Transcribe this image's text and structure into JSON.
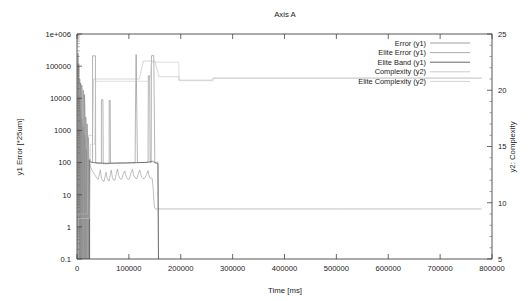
{
  "chart_data": {
    "type": "line",
    "title": "Axis A",
    "xlabel": "Time [ms]",
    "ylabel": "y1 Error [*25um]",
    "y2label": "y2: Complexity",
    "xlim": [
      0,
      800000
    ],
    "ylim": [
      0.1,
      1000000
    ],
    "y2lim": [
      5,
      25
    ],
    "yscale": "log",
    "grid": false,
    "legend_position": "top-right",
    "xticks": [
      0,
      100000,
      200000,
      300000,
      400000,
      500000,
      600000,
      700000,
      800000
    ],
    "xticklabels": [
      "0",
      "100000",
      "200000",
      "300000",
      "400000",
      "500000",
      "600000",
      "700000",
      "800000"
    ],
    "yticks": [
      0.1,
      1,
      10,
      100,
      1000,
      10000,
      100000,
      1000000
    ],
    "yticklabels": [
      "0.1",
      "1",
      "10",
      "100",
      "1000",
      "10000",
      "100000",
      "1e+006"
    ],
    "y2ticks": [
      5,
      10,
      15,
      20,
      25
    ],
    "y2ticklabels": [
      "5",
      "10",
      "15",
      "20",
      "25"
    ],
    "series": [
      {
        "name": "Error (y1)",
        "axis": "y1",
        "color": "#777777",
        "points": [
          [
            1500,
            0.1
          ],
          [
            1500,
            250000
          ],
          [
            2600,
            250000
          ],
          [
            2600,
            0.1
          ],
          [
            3400,
            0.1
          ],
          [
            3400,
            120000
          ],
          [
            4200,
            9000
          ],
          [
            4600,
            0.1
          ],
          [
            5200,
            0.1
          ],
          [
            5200,
            40000
          ],
          [
            6000,
            22000
          ],
          [
            6400,
            0.1
          ],
          [
            7000,
            0.1
          ],
          [
            7000,
            30000
          ],
          [
            7800,
            12000
          ],
          [
            8400,
            0.1
          ],
          [
            9200,
            0.1
          ],
          [
            9200,
            26000
          ],
          [
            10200,
            11000
          ],
          [
            11000,
            0.1
          ],
          [
            12000,
            0.1
          ],
          [
            12000,
            18000
          ],
          [
            13000,
            9000
          ],
          [
            13600,
            0.1
          ],
          [
            14500,
            0.1
          ],
          [
            14500,
            13000
          ],
          [
            15500,
            4000
          ],
          [
            16200,
            0.1
          ],
          [
            17000,
            0.1
          ],
          [
            17000,
            2600
          ],
          [
            18000,
            900
          ],
          [
            18600,
            0.1
          ],
          [
            19500,
            0.1
          ],
          [
            19500,
            1600
          ],
          [
            20500,
            400
          ],
          [
            21200,
            0.1
          ],
          [
            22000,
            0.1
          ],
          [
            22000,
            600
          ],
          [
            23000,
            180
          ],
          [
            23800,
            0.1
          ],
          [
            24500,
            0.1
          ],
          [
            24500,
            130
          ],
          [
            26000,
            105
          ],
          [
            29000,
            100
          ],
          [
            30000,
            100
          ],
          [
            30000,
            210000
          ],
          [
            35500,
            210000
          ],
          [
            36000,
            96
          ],
          [
            44000,
            94
          ],
          [
            47000,
            94
          ],
          [
            47000,
            9000
          ],
          [
            50000,
            9000
          ],
          [
            50500,
            92
          ],
          [
            60000,
            92
          ],
          [
            62000,
            92
          ],
          [
            62000,
            8500
          ],
          [
            64000,
            8500
          ],
          [
            64500,
            95
          ],
          [
            78000,
            96
          ],
          [
            88000,
            97
          ],
          [
            96000,
            97
          ],
          [
            105000,
            98
          ],
          [
            112000,
            98
          ],
          [
            112500,
            2000
          ],
          [
            114000,
            230000
          ],
          [
            115500,
            2000
          ],
          [
            116500,
            100
          ],
          [
            126000,
            100
          ],
          [
            133000,
            101
          ],
          [
            137000,
            101
          ],
          [
            137500,
            50000
          ],
          [
            140000,
            50000
          ],
          [
            141000,
            100
          ],
          [
            143000,
            100
          ],
          [
            143500,
            210000
          ],
          [
            148000,
            215000
          ],
          [
            150000,
            101
          ],
          [
            152000,
            102
          ],
          [
            153000,
            102
          ],
          [
            154500,
            103
          ],
          [
            156000,
            103
          ],
          [
            157200,
            0.1
          ]
        ]
      },
      {
        "name": "Elite Error (y1)",
        "axis": "y1",
        "color": "#8a8a8a",
        "points": [
          [
            2000,
            0.1
          ],
          [
            2000,
            120000
          ],
          [
            3000,
            14000
          ],
          [
            3600,
            0.1
          ],
          [
            4400,
            0.1
          ],
          [
            4400,
            11000
          ],
          [
            5400,
            3000
          ],
          [
            6000,
            0.1
          ],
          [
            6800,
            0.1
          ],
          [
            6800,
            4200
          ],
          [
            7600,
            1400
          ],
          [
            8200,
            0.1
          ],
          [
            9000,
            0.1
          ],
          [
            9000,
            2300
          ],
          [
            10000,
            1200
          ],
          [
            10800,
            0.1
          ],
          [
            11800,
            0.1
          ],
          [
            11800,
            1300
          ],
          [
            12800,
            600
          ],
          [
            13600,
            0.1
          ],
          [
            14600,
            0.1
          ],
          [
            14600,
            700
          ],
          [
            15800,
            300
          ],
          [
            16800,
            0.1
          ],
          [
            18000,
            0.1
          ],
          [
            18000,
            260
          ],
          [
            19500,
            120
          ],
          [
            21000,
            0.1
          ],
          [
            22500,
            0.1
          ],
          [
            22500,
            120
          ],
          [
            24500,
            90
          ],
          [
            26500,
            70
          ],
          [
            29000,
            58
          ],
          [
            32000,
            47
          ],
          [
            35000,
            40
          ],
          [
            38000,
            33
          ],
          [
            41000,
            30
          ],
          [
            43000,
            42
          ],
          [
            45000,
            60
          ],
          [
            46500,
            38
          ],
          [
            48000,
            30
          ],
          [
            50000,
            27
          ],
          [
            52000,
            26
          ],
          [
            54000,
            36
          ],
          [
            56000,
            50
          ],
          [
            58000,
            33
          ],
          [
            60000,
            28
          ],
          [
            62000,
            27
          ],
          [
            64000,
            40
          ],
          [
            66000,
            58
          ],
          [
            68000,
            36
          ],
          [
            70000,
            29
          ],
          [
            73000,
            28
          ],
          [
            76000,
            48
          ],
          [
            78000,
            63
          ],
          [
            80000,
            40
          ],
          [
            83000,
            31
          ],
          [
            86000,
            30
          ],
          [
            89000,
            44
          ],
          [
            92000,
            55
          ],
          [
            95000,
            35
          ],
          [
            98000,
            30
          ],
          [
            101000,
            31
          ],
          [
            104000,
            47
          ],
          [
            107000,
            62
          ],
          [
            109000,
            41
          ],
          [
            112000,
            33
          ],
          [
            115000,
            31
          ],
          [
            118000,
            43
          ],
          [
            121000,
            58
          ],
          [
            124000,
            38
          ],
          [
            127000,
            32
          ],
          [
            130000,
            32
          ],
          [
            134000,
            42
          ],
          [
            137000,
            56
          ],
          [
            139000,
            38
          ],
          [
            141000,
            33
          ],
          [
            143000,
            33
          ],
          [
            145000,
            32
          ],
          [
            147000,
            14
          ],
          [
            148500,
            5.5
          ],
          [
            150000,
            3.8
          ],
          [
            152000,
            3.6
          ],
          [
            156000,
            3.6
          ],
          [
            300000,
            3.6
          ],
          [
            500000,
            3.6
          ],
          [
            780000,
            3.6
          ]
        ]
      },
      {
        "name": "Elite Band (y1)",
        "axis": "y1",
        "color": "#555555",
        "points": [
          [
            24000,
            0.1
          ],
          [
            24000,
            115
          ],
          [
            26000,
            106
          ],
          [
            30000,
            100
          ],
          [
            40000,
            98
          ],
          [
            50000,
            96
          ],
          [
            60000,
            95
          ],
          [
            70000,
            96
          ],
          [
            80000,
            97
          ],
          [
            90000,
            97
          ],
          [
            100000,
            98
          ],
          [
            110000,
            99
          ],
          [
            120000,
            100
          ],
          [
            130000,
            101
          ],
          [
            138000,
            103
          ],
          [
            142000,
            108
          ],
          [
            146000,
            110
          ],
          [
            148000,
            104
          ],
          [
            150000,
            99
          ],
          [
            152000,
            96
          ],
          [
            154000,
            94
          ],
          [
            156000,
            92
          ],
          [
            157000,
            0.1
          ]
        ]
      },
      {
        "name": "Complexity (y2)",
        "axis": "y2",
        "color": "#b6b6b6",
        "points": [
          [
            2000,
            5
          ],
          [
            2000,
            9
          ],
          [
            20000,
            9
          ],
          [
            22000,
            16
          ],
          [
            30000,
            16
          ],
          [
            32000,
            21
          ],
          [
            120000,
            21
          ],
          [
            128000,
            22.6
          ],
          [
            150000,
            22.6
          ],
          [
            158000,
            21.2
          ],
          [
            196000,
            21.2
          ],
          [
            196500,
            20.9
          ],
          [
            260000,
            20.9
          ],
          [
            262000,
            21.1
          ],
          [
            780000,
            21.1
          ]
        ]
      },
      {
        "name": "Elite Complexity (y2)",
        "axis": "y2",
        "color": "#c2c2c2",
        "points": [
          [
            2000,
            5
          ],
          [
            2000,
            8.6
          ],
          [
            24000,
            8.6
          ],
          [
            26000,
            15.2
          ],
          [
            34000,
            15.2
          ],
          [
            36000,
            20.8
          ],
          [
            140000,
            20.8
          ],
          [
            144000,
            22.5
          ],
          [
            196000,
            22.5
          ],
          [
            197000,
            20.85
          ],
          [
            262000,
            20.85
          ],
          [
            263000,
            21.05
          ],
          [
            780000,
            21.05
          ]
        ]
      }
    ]
  },
  "legend": {
    "items": [
      {
        "label": "Error (y1)",
        "color": "#777777"
      },
      {
        "label": "Elite Error (y1)",
        "color": "#8a8a8a"
      },
      {
        "label": "Elite Band (y1)",
        "color": "#555555"
      },
      {
        "label": "Complexity (y2)",
        "color": "#b6b6b6"
      },
      {
        "label": "Elite Complexity (y2)",
        "color": "#c2c2c2"
      }
    ]
  }
}
